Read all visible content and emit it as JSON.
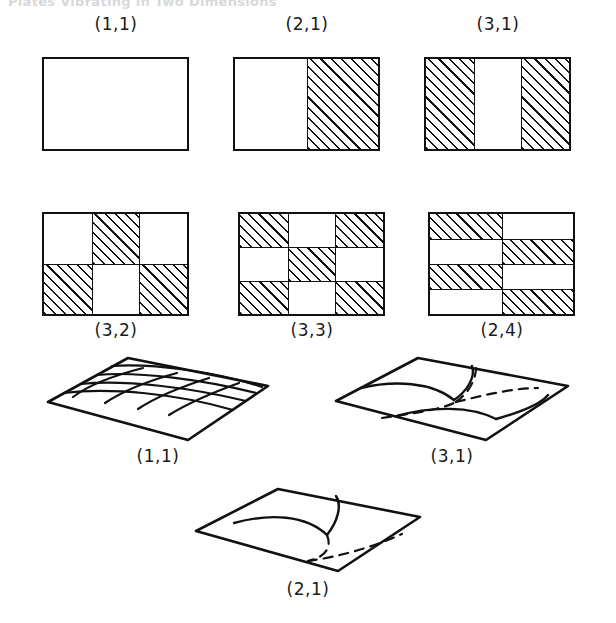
{
  "page": {
    "header_text": "Plates Vibrating in Two Dimensions",
    "background_color": "#ffffff",
    "ink_color": "#111111"
  },
  "plan_figures": {
    "caption_note": "Rectangular plate nodal-pattern plans; hatched cells vibrate out of phase with white cells.",
    "hatch_angle_deg": 45,
    "items": [
      {
        "label": "(1,1)",
        "cols": 1,
        "rows": 1,
        "pattern": [
          [
            "w"
          ]
        ],
        "x": 42,
        "y": 57,
        "w": 147,
        "h": 94,
        "label_x": 116,
        "label_y": 26
      },
      {
        "label": "(2,1)",
        "cols": 2,
        "rows": 1,
        "pattern": [
          [
            "w",
            "h"
          ]
        ],
        "x": 233,
        "y": 57,
        "w": 147,
        "h": 94,
        "label_x": 307,
        "label_y": 26
      },
      {
        "label": "(3,1)",
        "cols": 3,
        "rows": 1,
        "pattern": [
          [
            "h",
            "w",
            "h"
          ]
        ],
        "x": 424,
        "y": 57,
        "w": 147,
        "h": 94,
        "label_x": 498,
        "label_y": 26
      },
      {
        "label": "(3,2)",
        "cols": 3,
        "rows": 2,
        "pattern": [
          [
            "w",
            "h",
            "w"
          ],
          [
            "h",
            "w",
            "h"
          ]
        ],
        "x": 42,
        "y": 212,
        "w": 147,
        "h": 104,
        "label_x": 116,
        "label_y": 318
      },
      {
        "label": "(3,3)",
        "cols": 3,
        "rows": 3,
        "pattern": [
          [
            "h",
            "w",
            "h"
          ],
          [
            "w",
            "h",
            "w"
          ],
          [
            "h",
            "w",
            "h"
          ]
        ],
        "x": 238,
        "y": 212,
        "w": 147,
        "h": 104,
        "label_x": 312,
        "label_y": 318
      },
      {
        "label": "(2,4)",
        "cols": 2,
        "rows": 4,
        "pattern": [
          [
            "h",
            "w"
          ],
          [
            "w",
            "h"
          ],
          [
            "h",
            "w"
          ],
          [
            "w",
            "h"
          ]
        ],
        "x": 428,
        "y": 212,
        "w": 147,
        "h": 104,
        "label_x": 502,
        "label_y": 318
      }
    ]
  },
  "plate_figures": {
    "caption_note": "Perspective views of the vibrating rectangular plate showing nodal lines (solid = crest side, dashed = hidden/trough side).",
    "items": [
      {
        "label": "(1,1)",
        "kind": "grid-mesh",
        "x": 48,
        "y": 356,
        "w": 220,
        "h": 82,
        "label_x": 158,
        "label_y": 445
      },
      {
        "label": "(3,1)",
        "kind": "nodal-3-1",
        "x": 336,
        "y": 356,
        "w": 232,
        "h": 82,
        "label_x": 452,
        "label_y": 445
      },
      {
        "label": "(2,1)",
        "kind": "nodal-2-1",
        "x": 196,
        "y": 487,
        "w": 224,
        "h": 82,
        "label_x": 308,
        "label_y": 578
      }
    ]
  }
}
